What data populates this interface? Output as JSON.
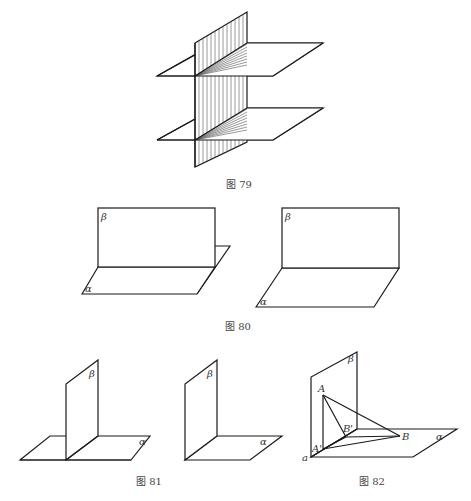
{
  "figures": [
    {
      "id": "fig79",
      "caption": "图 79",
      "description": "A vertical plane intersecting two parallel horizontal planes; shaded intersection regions"
    },
    {
      "id": "fig80",
      "caption": "图 80",
      "labels": {
        "beta": "β",
        "alpha": "α"
      },
      "panels": 2
    },
    {
      "id": "fig81",
      "caption": "图 81",
      "labels": {
        "beta": "β",
        "alpha": "α"
      },
      "panels": 2
    },
    {
      "id": "fig82",
      "caption": "图 82",
      "labels": {
        "beta": "β",
        "alpha": "α",
        "a": "a",
        "A": "A",
        "A_prime": "A'",
        "B": "B",
        "B_prime": "B'"
      }
    }
  ],
  "colors": {
    "stroke": "#1a1a1a",
    "caption": "#444444",
    "background": "#ffffff"
  }
}
